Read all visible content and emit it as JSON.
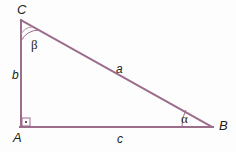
{
  "figure": {
    "kind": "geometry-diagram",
    "background_color": "#fdfdfd",
    "stroke_color": "#9b6d8b",
    "text_color": "#231f20",
    "stroke_width": 2
  },
  "vertices": [
    {
      "id": "C",
      "label": "C",
      "x": 21,
      "y": 20
    },
    {
      "id": "A",
      "label": "A",
      "x": 21,
      "y": 127
    },
    {
      "id": "B",
      "label": "B",
      "x": 212,
      "y": 127
    }
  ],
  "sides": [
    {
      "id": "a",
      "label": "a",
      "from": "C",
      "to": "B",
      "role": "hypotenuse"
    },
    {
      "id": "b",
      "label": "b",
      "from": "A",
      "to": "C",
      "role": "leg-vertical"
    },
    {
      "id": "c",
      "label": "c",
      "from": "A",
      "to": "B",
      "role": "leg-horizontal"
    }
  ],
  "angles": [
    {
      "id": "beta",
      "label": "β",
      "at": "C",
      "marker": "arc"
    },
    {
      "id": "alpha",
      "label": "α",
      "at": "B",
      "marker": "arc"
    },
    {
      "id": "right",
      "label": "",
      "at": "A",
      "marker": "square-with-dot"
    }
  ]
}
